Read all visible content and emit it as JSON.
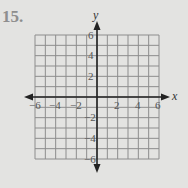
{
  "problem": {
    "number": "15."
  },
  "axes": {
    "x_label": "x",
    "y_label": "y",
    "x_ticks": [
      "−6",
      "−4",
      "−2",
      "2",
      "4",
      "6"
    ],
    "y_ticks": [
      "6",
      "4",
      "2",
      "−2",
      "−4",
      "−6"
    ]
  },
  "grid": {
    "min": -6,
    "max": 6,
    "step": 1,
    "line_color": "#8d8d8d",
    "axis_color": "#222222",
    "background": "#e3e3e1"
  }
}
